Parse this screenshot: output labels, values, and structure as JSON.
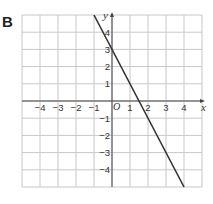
{
  "panel_label": "B",
  "chart_data": {
    "type": "line",
    "title": "",
    "xlabel": "x",
    "ylabel": "y",
    "origin_label": "O",
    "xlim": [
      -5,
      5
    ],
    "ylim": [
      -5,
      5
    ],
    "grid": true,
    "x_ticks": [
      -4,
      -3,
      -2,
      -1,
      1,
      2,
      3,
      4
    ],
    "y_ticks": [
      -4,
      -3,
      -2,
      -1,
      1,
      2,
      3,
      4
    ],
    "x_tick_labels": [
      "−4",
      "−3",
      "−2",
      "−1",
      "1",
      "2",
      "3",
      "4"
    ],
    "y_tick_labels": [
      "−4",
      "−3",
      "−2",
      "−1",
      "1",
      "2",
      "3",
      "4"
    ],
    "series": [
      {
        "name": "y = -2x + 3",
        "x": [
          -1,
          4
        ],
        "y": [
          5,
          -5
        ],
        "color": "#333333"
      }
    ]
  }
}
